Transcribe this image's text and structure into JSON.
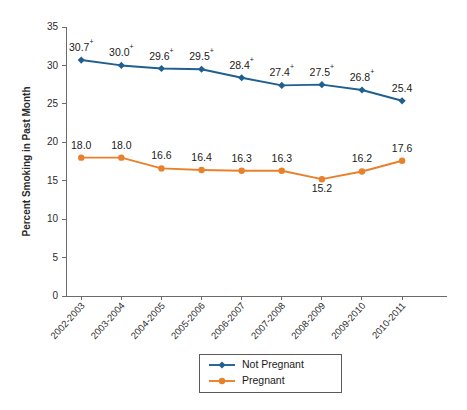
{
  "chart_data": {
    "type": "line",
    "title": "",
    "xlabel": "",
    "ylabel": "Percent Smoking in Past Month",
    "ylim": [
      0,
      35
    ],
    "yticks": [
      0,
      5,
      10,
      15,
      20,
      25,
      30,
      35
    ],
    "grid": false,
    "legend_position": "bottom-center",
    "categories": [
      "2002-2003",
      "2003-2004",
      "2004-2005",
      "2005-2006",
      "2006-2007",
      "2007-2008",
      "2008-2009",
      "2009-2010",
      "2010-2011"
    ],
    "series": [
      {
        "name": "Not Pregnant",
        "color": "#1f6091",
        "marker": "diamond",
        "values": [
          30.7,
          30.0,
          29.6,
          29.5,
          28.4,
          27.4,
          27.5,
          26.8,
          25.4
        ],
        "labels": [
          "30.7",
          "30.0",
          "29.6",
          "29.5",
          "28.4",
          "27.4",
          "27.5",
          "26.8",
          "25.4"
        ],
        "significance": [
          "+",
          "+",
          "+",
          "+",
          "+",
          "+",
          "+",
          "+",
          ""
        ]
      },
      {
        "name": "Pregnant",
        "color": "#e8812b",
        "marker": "circle",
        "values": [
          18.0,
          18.0,
          16.6,
          16.4,
          16.3,
          16.3,
          15.2,
          16.2,
          17.6
        ],
        "labels": [
          "18.0",
          "18.0",
          "16.6",
          "16.4",
          "16.3",
          "16.3",
          "15.2",
          "16.2",
          "17.6"
        ],
        "significance": [
          "",
          "",
          "",
          "",
          "",
          "",
          "",
          "",
          ""
        ]
      }
    ]
  },
  "legend": {
    "items": [
      {
        "label": "Not Pregnant",
        "color": "#1f6091",
        "marker": "diamond"
      },
      {
        "label": "Pregnant",
        "color": "#e8812b",
        "marker": "circle"
      }
    ]
  }
}
